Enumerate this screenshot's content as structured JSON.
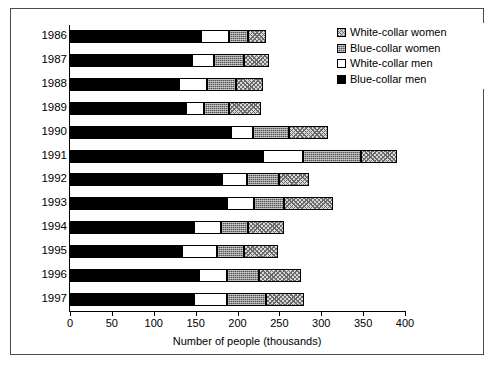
{
  "chart_data": {
    "type": "bar",
    "orientation": "horizontal",
    "stacked": true,
    "title": "",
    "xlabel": "Number of people (thousands)",
    "ylabel": "",
    "xlim": [
      0,
      400
    ],
    "xticks": [
      0,
      50,
      100,
      150,
      200,
      250,
      300,
      350,
      400
    ],
    "grid": false,
    "legend_position": "top-right",
    "categories": [
      "1986",
      "1987",
      "1988",
      "1989",
      "1990",
      "1991",
      "1992",
      "1993",
      "1994",
      "1995",
      "1996",
      "1997"
    ],
    "series": [
      {
        "name": "Blue-collar men",
        "swatch": "#000000",
        "pattern": "solid-black",
        "values": [
          156,
          146,
          130,
          138,
          192,
          230,
          181,
          188,
          148,
          134,
          154,
          148
        ]
      },
      {
        "name": "White-collar men",
        "swatch": "#ffffff",
        "pattern": "solid-white",
        "values": [
          34,
          26,
          34,
          22,
          26,
          48,
          30,
          32,
          32,
          42,
          34,
          40
        ]
      },
      {
        "name": "Blue-collar women",
        "swatch": "#555555",
        "pattern": "fine-cross-hatch-dark",
        "values": [
          22,
          36,
          34,
          30,
          44,
          70,
          38,
          36,
          32,
          32,
          38,
          46
        ]
      },
      {
        "name": "White-collar women",
        "swatch": "#d8d8d8",
        "pattern": "diagonal-cross-hatch-light",
        "values": [
          22,
          30,
          32,
          38,
          46,
          42,
          36,
          58,
          44,
          40,
          50,
          46
        ]
      }
    ],
    "totals": [
      234,
      238,
      230,
      228,
      308,
      390,
      285,
      314,
      256,
      248,
      276,
      280
    ]
  },
  "legend": {
    "items": [
      {
        "label": "White-collar women",
        "swatch_class": "sw-wcw"
      },
      {
        "label": "Blue-collar women",
        "swatch_class": "sw-bcw"
      },
      {
        "label": "White-collar men",
        "swatch_class": "sw-wcm"
      },
      {
        "label": "Blue-collar men",
        "swatch_class": "sw-bcm"
      }
    ]
  }
}
